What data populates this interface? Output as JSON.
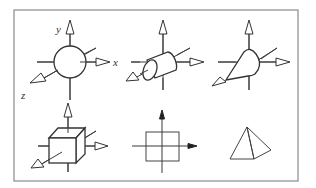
{
  "diagram": {
    "frame": {
      "x": 14,
      "y": 10,
      "width": 284,
      "height": 171,
      "stroke": "#8a8a8a"
    },
    "axis_labels": {
      "y": "y",
      "x": "x",
      "z": "z"
    },
    "panels": [
      {
        "id": "sphere",
        "shape": "sphere",
        "row": 1,
        "col": 1,
        "axes": "3D open arrowheads",
        "labels_shown": [
          "y",
          "x",
          "z"
        ]
      },
      {
        "id": "cylinder",
        "shape": "cylinder",
        "row": 1,
        "col": 2,
        "axes": "3D open arrowheads"
      },
      {
        "id": "cone",
        "shape": "cone",
        "row": 1,
        "col": 3,
        "axes": "3D open arrowheads"
      },
      {
        "id": "cube",
        "shape": "cube",
        "row": 2,
        "col": 1,
        "axes": "3D open arrowheads"
      },
      {
        "id": "square-2d",
        "shape": "square",
        "row": 2,
        "col": 2,
        "axes": "2D solid arrowheads (up, right)"
      },
      {
        "id": "pyramid",
        "shape": "pyramid",
        "row": 2,
        "col": 3,
        "axes": "none"
      }
    ],
    "colors": {
      "line": "#333333",
      "frame": "#8a8a8a",
      "background": "#ffffff"
    }
  }
}
